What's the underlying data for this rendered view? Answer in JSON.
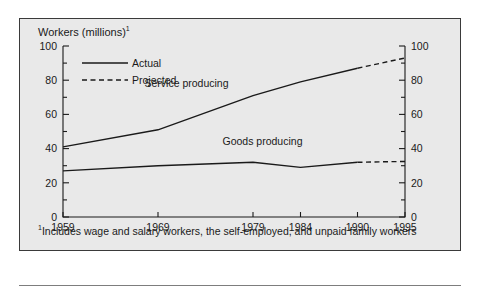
{
  "figure": {
    "axis_title": "Workers (millions)",
    "axis_title_superscript": "1",
    "footnote_marker": "1",
    "footnote": "Includes wage and salary workers, the self-employed, and unpaid family workers",
    "background_color": "#e9e9e9",
    "border_color": "#3a3a3a",
    "ink_color": "#1a1a1a"
  },
  "legend": {
    "position": "inside-top-left",
    "entries": [
      {
        "label": "Actual",
        "style": "solid"
      },
      {
        "label": "Projected",
        "style": "dashed"
      }
    ]
  },
  "chart_data": {
    "type": "line",
    "title": "",
    "subtitle": "",
    "xlabel": "",
    "ylabel": "Workers (millions)",
    "xlim": [
      1959,
      1995
    ],
    "ylim": [
      0,
      100
    ],
    "grid": false,
    "legend_position": "inside-top-left",
    "x": [
      1959,
      1969,
      1979,
      1984,
      1990,
      1995
    ],
    "categories": [
      "1959",
      "1969",
      "1979",
      "1984",
      "1990",
      "1995"
    ],
    "x_tick_labels": [
      "1959",
      "1969",
      "1979",
      "1984",
      "1990",
      "1995"
    ],
    "y_tick_labels": [
      "0",
      "20",
      "40",
      "60",
      "80",
      "100"
    ],
    "y_ticks_major": [
      0,
      20,
      40,
      60,
      80,
      100
    ],
    "y_ticks_minor": [
      10,
      30,
      50,
      70,
      90
    ],
    "right_axis_tick_labels": [
      "0",
      "20",
      "40",
      "60",
      "80",
      "100"
    ],
    "annotations": [
      {
        "text": "Service producing",
        "x": 1972,
        "y": 76
      },
      {
        "text": "Goods producing",
        "x": 1980,
        "y": 42
      }
    ],
    "series": [
      {
        "name": "Service producing",
        "actual_x": [
          1959,
          1969,
          1979,
          1984,
          1990
        ],
        "actual_values": [
          41,
          51,
          71,
          79,
          87
        ],
        "projected_x": [
          1990,
          1995
        ],
        "projected_values": [
          87,
          93
        ]
      },
      {
        "name": "Goods producing",
        "actual_x": [
          1959,
          1969,
          1979,
          1984,
          1990
        ],
        "actual_values": [
          27,
          30,
          32,
          29,
          32
        ],
        "projected_x": [
          1990,
          1995
        ],
        "projected_values": [
          32,
          32.5
        ]
      }
    ]
  }
}
